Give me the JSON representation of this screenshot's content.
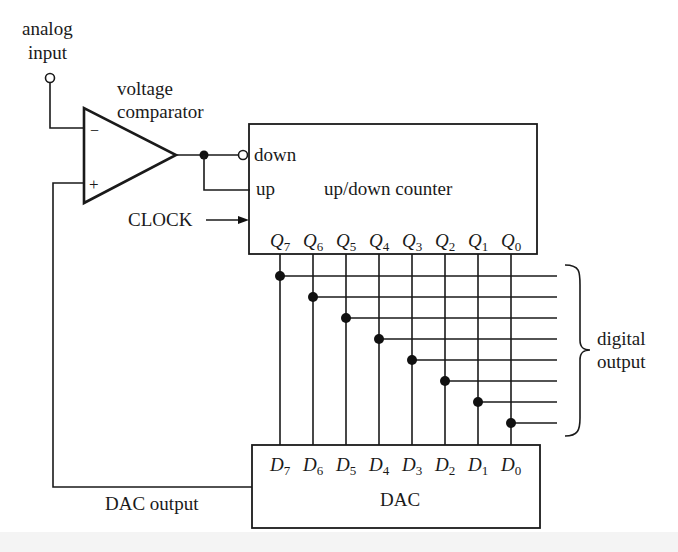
{
  "diagram": {
    "labels": {
      "analog_input_line1": "analog",
      "analog_input_line2": "input",
      "comparator_line1": "voltage",
      "comparator_line2": "comparator",
      "minus_sign": "−",
      "plus_sign": "+",
      "down": "down",
      "up": "up",
      "counter": "up/down counter",
      "clock": "CLOCK",
      "digital_output_line1": "digital",
      "digital_output_line2": "output",
      "dac": "DAC",
      "dac_output": "DAC output"
    },
    "counter_outputs": [
      {
        "letter": "Q",
        "index": "7"
      },
      {
        "letter": "Q",
        "index": "6"
      },
      {
        "letter": "Q",
        "index": "5"
      },
      {
        "letter": "Q",
        "index": "4"
      },
      {
        "letter": "Q",
        "index": "3"
      },
      {
        "letter": "Q",
        "index": "2"
      },
      {
        "letter": "Q",
        "index": "1"
      },
      {
        "letter": "Q",
        "index": "0"
      }
    ],
    "dac_inputs": [
      {
        "letter": "D",
        "index": "7"
      },
      {
        "letter": "D",
        "index": "6"
      },
      {
        "letter": "D",
        "index": "5"
      },
      {
        "letter": "D",
        "index": "4"
      },
      {
        "letter": "D",
        "index": "3"
      },
      {
        "letter": "D",
        "index": "2"
      },
      {
        "letter": "D",
        "index": "1"
      },
      {
        "letter": "D",
        "index": "0"
      }
    ],
    "nodes": [
      "analog input",
      "voltage comparator",
      "up/down counter",
      "DAC",
      "digital output"
    ],
    "edges": [
      {
        "from": "analog input",
        "to": "voltage comparator (−)"
      },
      {
        "from": "voltage comparator",
        "to": "up/down counter (down, inverted)"
      },
      {
        "from": "voltage comparator",
        "to": "up/down counter (up)"
      },
      {
        "from": "CLOCK",
        "to": "up/down counter"
      },
      {
        "from": "up/down counter Q7..Q0",
        "to": "DAC D7..D0"
      },
      {
        "from": "up/down counter Q7..Q0",
        "to": "digital output"
      },
      {
        "from": "DAC output",
        "to": "voltage comparator (+)"
      }
    ]
  }
}
